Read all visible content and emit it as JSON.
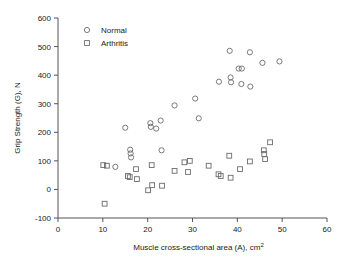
{
  "chart_data": {
    "type": "scatter",
    "title": "",
    "xlabel": "Muscle cross-sectional area (A), cm",
    "xlabel_sup": "2",
    "ylabel": "Grip Strength (G), N",
    "xlim": [
      0,
      60
    ],
    "ylim": [
      -100,
      600
    ],
    "xticks": [
      0,
      10,
      20,
      30,
      40,
      50,
      60
    ],
    "yticks": [
      -100,
      0,
      100,
      200,
      300,
      400,
      500,
      600
    ],
    "grid": false,
    "legend_position": "top-left",
    "series": [
      {
        "name": "Normal",
        "marker": "circle",
        "color": "#6b6b6b",
        "points": [
          [
            12.8,
            79
          ],
          [
            15.0,
            216
          ],
          [
            16.1,
            139
          ],
          [
            16.2,
            126
          ],
          [
            16.3,
            112
          ],
          [
            20.6,
            232
          ],
          [
            20.7,
            219
          ],
          [
            21.9,
            213
          ],
          [
            22.9,
            241
          ],
          [
            23.1,
            137
          ],
          [
            26.0,
            294
          ],
          [
            30.6,
            318
          ],
          [
            31.4,
            249
          ],
          [
            35.9,
            377
          ],
          [
            38.3,
            485
          ],
          [
            38.5,
            392
          ],
          [
            38.6,
            375
          ],
          [
            40.3,
            423
          ],
          [
            41.0,
            423
          ],
          [
            40.9,
            369
          ],
          [
            42.8,
            480
          ],
          [
            42.9,
            360
          ],
          [
            45.6,
            443
          ],
          [
            49.4,
            448
          ]
        ]
      },
      {
        "name": "Arthritis",
        "marker": "square",
        "color": "#6b6b6b",
        "points": [
          [
            10.1,
            85
          ],
          [
            10.9,
            83
          ],
          [
            10.4,
            -50
          ],
          [
            15.6,
            47
          ],
          [
            16.0,
            43
          ],
          [
            17.4,
            71
          ],
          [
            17.6,
            36
          ],
          [
            20.1,
            -3
          ],
          [
            20.9,
            85
          ],
          [
            21.0,
            15
          ],
          [
            23.2,
            13
          ],
          [
            26.0,
            65
          ],
          [
            28.2,
            95
          ],
          [
            29.4,
            100
          ],
          [
            29.0,
            61
          ],
          [
            33.6,
            83
          ],
          [
            35.8,
            53
          ],
          [
            36.3,
            47
          ],
          [
            38.2,
            118
          ],
          [
            38.5,
            41
          ],
          [
            40.6,
            71
          ],
          [
            42.8,
            98
          ],
          [
            45.9,
            137
          ],
          [
            46.0,
            124
          ],
          [
            46.2,
            106
          ],
          [
            47.3,
            165
          ]
        ]
      }
    ]
  },
  "legend": {
    "items": [
      {
        "label": "Normal",
        "marker": "circle"
      },
      {
        "label": "Arthritis",
        "marker": "square"
      }
    ]
  }
}
